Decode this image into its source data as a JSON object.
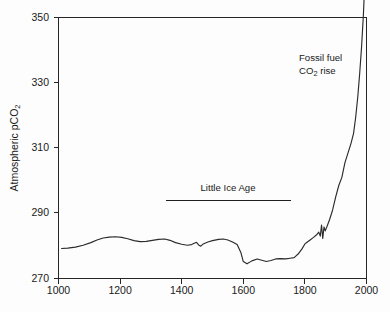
{
  "figure": {
    "background_color": "#fdfdfd",
    "line_color": "#2b2b2b",
    "axis_color": "#262626"
  },
  "chart_data": {
    "type": "line",
    "title": "",
    "xlabel": "",
    "ylabel": "Atmospheric pCO2",
    "ylabel_main": "Atmospheric pCO",
    "ylabel_sub": "2",
    "xlim": [
      1000,
      2000
    ],
    "ylim": [
      270,
      350
    ],
    "xticks": [
      1000,
      1200,
      1400,
      1600,
      1800,
      2000
    ],
    "xtick_labels": [
      "1000",
      "1200",
      "1400",
      "1600",
      "1800",
      "2000"
    ],
    "yticks": [
      270,
      290,
      310,
      330,
      350
    ],
    "ytick_labels": [
      "270",
      "290",
      "310",
      "330",
      "350"
    ],
    "grid": false,
    "legend": "none",
    "series": [
      {
        "name": "Atmospheric pCO2 (ice core + instrumental)",
        "x": [
          1010,
          1030,
          1055,
          1080,
          1105,
          1125,
          1145,
          1165,
          1185,
          1205,
          1225,
          1245,
          1265,
          1285,
          1305,
          1325,
          1345,
          1362,
          1380,
          1400,
          1418,
          1432,
          1448,
          1455,
          1462,
          1470,
          1485,
          1500,
          1520,
          1535,
          1550,
          1565,
          1580,
          1592,
          1600,
          1612,
          1628,
          1645,
          1660,
          1675,
          1690,
          1705,
          1720,
          1738,
          1752,
          1765,
          1778,
          1790,
          1800,
          1808,
          1818,
          1828,
          1838,
          1845,
          1850,
          1854,
          1858,
          1862,
          1866,
          1872,
          1880,
          1890,
          1900,
          1910,
          1920,
          1930,
          1940,
          1950,
          1958,
          1965,
          1972,
          1978,
          1984,
          1990,
          1995
        ],
        "y": [
          279.2,
          279.3,
          279.6,
          280.2,
          281.0,
          281.8,
          282.4,
          282.7,
          282.8,
          282.6,
          282.2,
          281.6,
          281.3,
          281.4,
          281.7,
          282.0,
          282.1,
          281.7,
          281.0,
          280.5,
          280.2,
          280.4,
          281.1,
          280.3,
          279.9,
          280.6,
          281.2,
          281.6,
          282.0,
          282.1,
          281.8,
          281.2,
          280.4,
          278.0,
          275.2,
          274.5,
          275.4,
          276.0,
          275.6,
          275.2,
          275.5,
          276.0,
          276.1,
          276.0,
          276.2,
          276.4,
          277.5,
          279.0,
          280.6,
          281.2,
          281.9,
          282.6,
          283.4,
          284.2,
          283.0,
          286.4,
          282.3,
          285.8,
          284.6,
          286.0,
          288.0,
          291.0,
          295.0,
          298.5,
          301.0,
          305.5,
          308.5,
          311.5,
          314.5,
          319.5,
          326.0,
          333.0,
          341.0,
          351.0,
          362.0
        ]
      }
    ],
    "annotations": [
      {
        "id": "fossil-fuel-annotation",
        "line1": "Fossil fuel",
        "line2_main": "CO",
        "line2_sub": "2",
        "line2_tail": " rise",
        "x": 299,
        "y": 57
      },
      {
        "id": "little-ice-age-annotation",
        "label": "Little Ice Age",
        "bar_x_start": 1350,
        "bar_x_end": 1762,
        "bar_y_value": 292.4,
        "label_x": 228,
        "label_y": 191
      }
    ]
  }
}
